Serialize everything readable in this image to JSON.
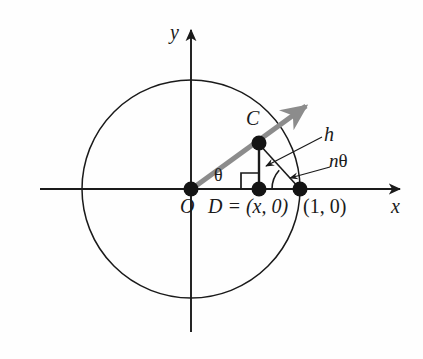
{
  "figure": {
    "name": "unit-circle-multiple-angle-diagram",
    "type": "geometry-diagram",
    "background_color": "#fefefe",
    "ink_color": "#1a1a1a",
    "ray_color": "#8c8c8c"
  },
  "axes": {
    "x_label": "x",
    "y_label": "y",
    "origin_px": [
      191,
      189
    ],
    "x_axis_from_px": [
      40,
      189
    ],
    "x_axis_to_px": [
      402,
      189
    ],
    "y_axis_from_px": [
      191,
      330
    ],
    "y_axis_to_px": [
      191,
      28
    ]
  },
  "circle": {
    "center_px": [
      191,
      189
    ],
    "radius_px": 109,
    "label": "unit-circle"
  },
  "points": [
    {
      "name": "origin",
      "label": "O",
      "px": [
        191,
        189
      ],
      "label_px": [
        180,
        196
      ]
    },
    {
      "name": "point-c",
      "label": "C",
      "px": [
        259,
        143
      ],
      "label_px": [
        246,
        111
      ]
    },
    {
      "name": "point-d",
      "label": "D = (x, 0)",
      "px": [
        259,
        189
      ],
      "label_px": [
        210,
        196
      ]
    },
    {
      "name": "point-one-zero",
      "label": "(1, 0)",
      "px": [
        300,
        189
      ],
      "label_px": [
        304,
        196
      ]
    }
  ],
  "segments": [
    {
      "name": "ray-o-to-c-extended",
      "from_px": [
        191,
        189
      ],
      "to_px": [
        310,
        103
      ],
      "color": "#8c8c8c",
      "width": 5,
      "arrow": true
    },
    {
      "name": "segment-c-to-d",
      "from_px": [
        259,
        143
      ],
      "to_px": [
        259,
        189
      ],
      "color": "#1a1a1a",
      "width": 2
    },
    {
      "name": "segment-c-to-one-zero",
      "from_px": [
        259,
        143
      ],
      "to_px": [
        300,
        189
      ],
      "color": "#1a1a1a",
      "width": 1.6
    }
  ],
  "angle_marks": [
    {
      "name": "angle-theta-at-origin",
      "label": "θ",
      "label_px": [
        215,
        168
      ],
      "vertex_px": [
        191,
        189
      ]
    },
    {
      "name": "angle-ntheta-at-one-zero",
      "label": "nθ",
      "label_px": [
        330,
        154
      ],
      "vertex_px": [
        300,
        189
      ],
      "arc_radius_px": 28
    },
    {
      "name": "right-angle-at-d",
      "label": "right-angle-marker",
      "vertex_px": [
        259,
        189
      ],
      "size_px": 16
    }
  ],
  "callouts": [
    {
      "name": "callout-h",
      "label": "h",
      "label_px": [
        325,
        127
      ],
      "leader_from_px": [
        320,
        138
      ],
      "leader_to_px": [
        265,
        166
      ]
    },
    {
      "name": "callout-ntheta",
      "label_parts": {
        "n": "n",
        "theta": "θ"
      },
      "label_px": [
        330,
        154
      ],
      "leader_from_px": [
        328,
        167
      ],
      "leader_to_px": [
        291,
        177
      ]
    }
  ],
  "labels": {
    "y_axis": "y",
    "x_axis": "x",
    "origin": "O",
    "point_c": "C",
    "point_d": "D = (x, 0)",
    "point_unit": "(1, 0)",
    "theta": "θ",
    "h": "h",
    "n_theta_n": "n",
    "n_theta_theta": "θ"
  }
}
